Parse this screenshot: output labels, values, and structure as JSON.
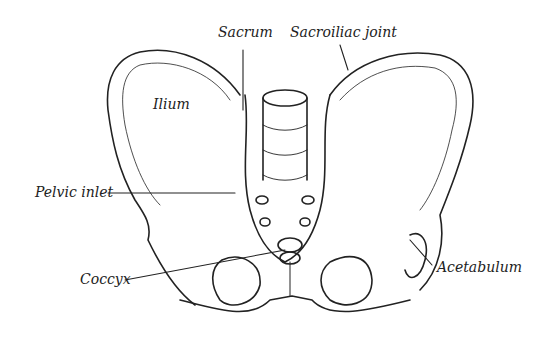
{
  "figure": {
    "labels": {
      "sacrum": "Sacrum",
      "sacroiliac_joint": "Sacroiliac joint",
      "ilium": "Ilium",
      "pelvic_inlet": "Pelvic inlet",
      "coccyx": "Coccyx",
      "acetabulum": "Acetabulum"
    },
    "colors": {
      "ink": "#222222",
      "background": "#ffffff"
    }
  }
}
